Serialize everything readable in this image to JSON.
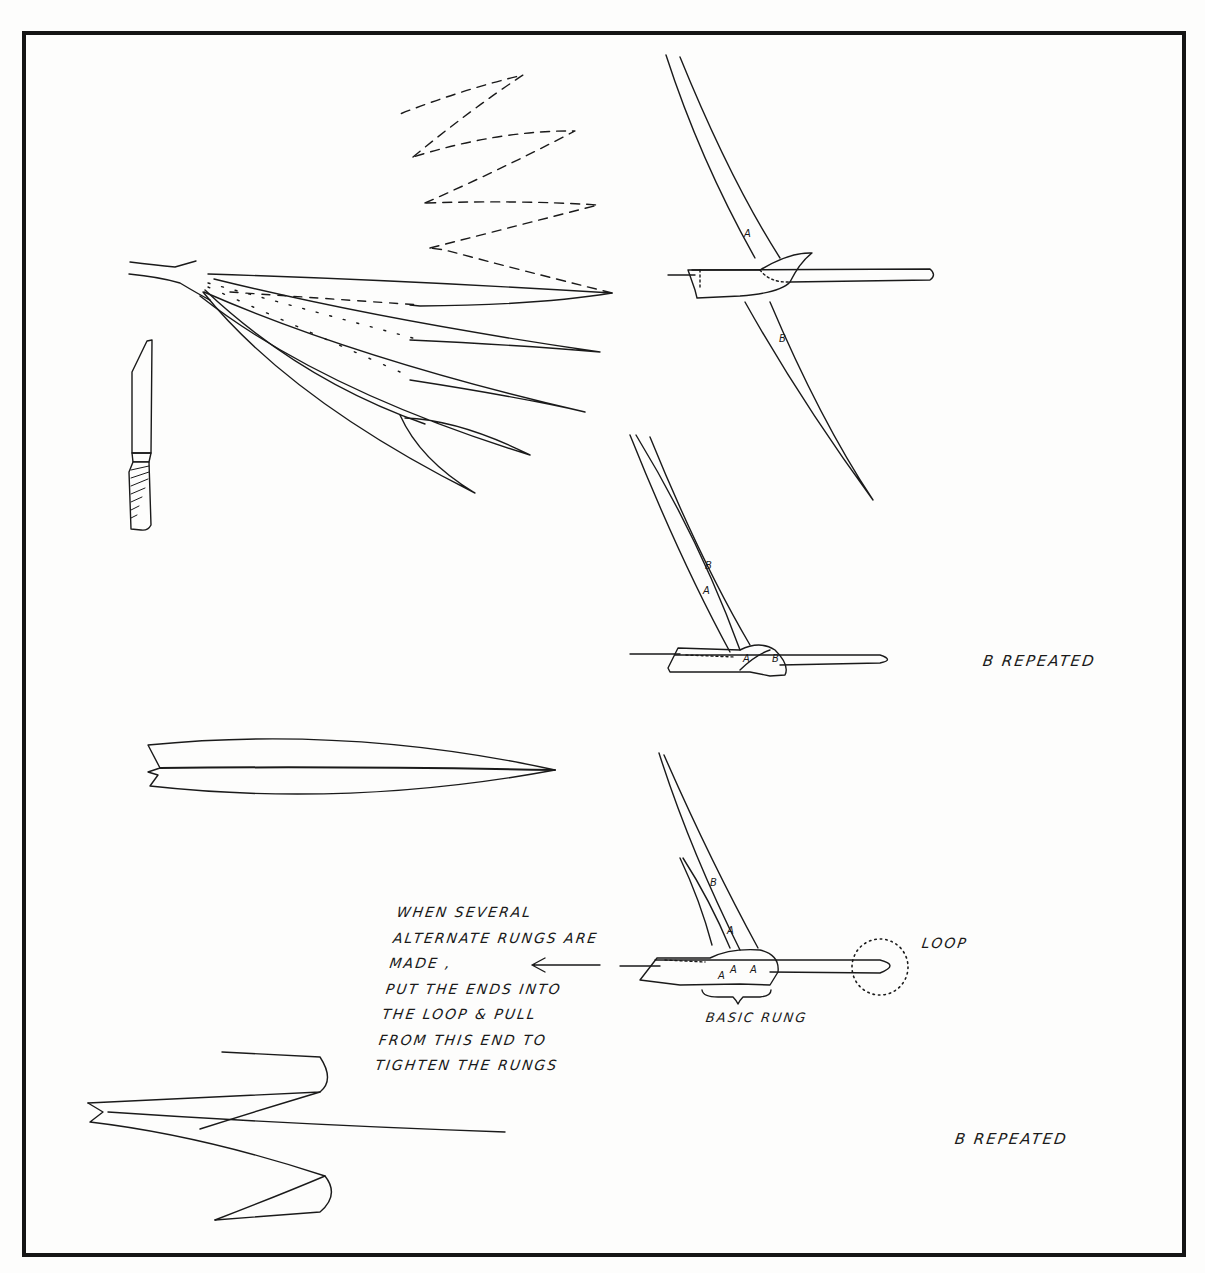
{
  "diagram": {
    "colors": {
      "ink": "#1a1a1a",
      "paper": "#fdfdfc",
      "frame": "#151515"
    },
    "labels": {
      "strand_a": "A",
      "strand_b": "B",
      "b_repeated_top": "B   REPEATED",
      "b_repeated_bottom": "B   REPEATED",
      "loop": "LOOP",
      "basic_rung": "BASIC RUNG"
    },
    "instruction_note": {
      "lines": [
        "WHEN  SEVERAL",
        "ALTERNATE  RUNGS ARE",
        "MADE ,",
        "PUT THE ENDS INTO",
        "THE LOOP & PULL",
        "FROM THIS END TO",
        "TIGHTEN THE RUNGS"
      ]
    },
    "figures": [
      "knife",
      "leaf-splitting-fan",
      "rung-step-1",
      "rung-step-2",
      "split-leaf",
      "rung-step-3-basic-rung",
      "folded-leaf-zigzag"
    ]
  }
}
